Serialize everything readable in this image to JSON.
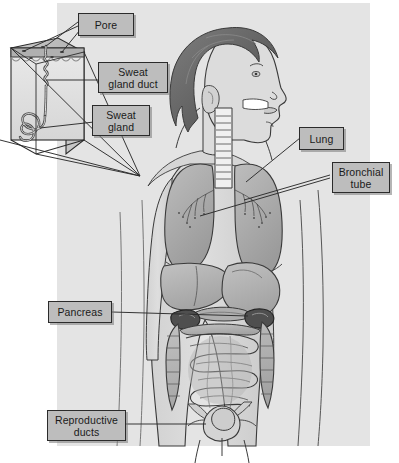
{
  "figure": {
    "panel_bg": "#e4e4e4",
    "page_bg": "#ffffff",
    "label_bg": "#bdbdbd",
    "label_border": "#2b2b2b",
    "line_color": "#2b2b2b",
    "organ_fill": "#b9b9b9",
    "organ_fill_dark": "#8d8d8d",
    "body_fill": "#dcdcdc",
    "hair_fill": "#6f6f6f"
  },
  "labels": [
    {
      "id": "pore",
      "text": "Pore",
      "lines": [
        "Pore"
      ]
    },
    {
      "id": "sweat-gland-duct",
      "text": "Sweat gland duct",
      "lines": [
        "Sweat",
        "gland duct"
      ]
    },
    {
      "id": "sweat-gland",
      "text": "Sweat gland",
      "lines": [
        "Sweat",
        "gland"
      ]
    },
    {
      "id": "lung",
      "text": "Lung",
      "lines": [
        "Lung"
      ]
    },
    {
      "id": "bronchial-tube",
      "text": "Bronchial tube",
      "lines": [
        "Bronchial",
        "tube"
      ]
    },
    {
      "id": "pancreas",
      "text": "Pancreas",
      "lines": [
        "Pancreas"
      ]
    },
    {
      "id": "reproductive-ducts",
      "text": "Reproductive ducts",
      "lines": [
        "Reproductive",
        "ducts"
      ]
    }
  ],
  "label_text": {
    "pore": "Pore",
    "duct_l1": "Sweat",
    "duct_l2": "gland duct",
    "gland_l1": "Sweat",
    "gland_l2": "gland",
    "lung": "Lung",
    "bronchial_l1": "Bronchial",
    "bronchial_l2": "tube",
    "pancreas": "Pancreas",
    "repro_l1": "Reproductive",
    "repro_l2": "ducts"
  },
  "anatomy": {
    "inset": {
      "name": "skin-cross-section-block",
      "parts": [
        "epidermis",
        "dermis",
        "pore",
        "sweat-gland-duct",
        "sweat-gland-coil"
      ]
    },
    "body_parts": [
      "head-profile",
      "hair",
      "ear",
      "neck",
      "trachea",
      "left-lung",
      "right-lung",
      "bronchial-tubes",
      "liver",
      "stomach",
      "pancreas",
      "left-kidney",
      "right-kidney",
      "large-intestine",
      "small-intestine",
      "bladder",
      "reproductive-organs",
      "arms",
      "legs",
      "torso-outline"
    ]
  }
}
